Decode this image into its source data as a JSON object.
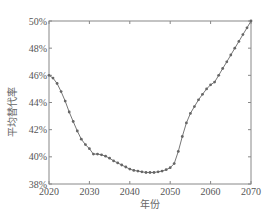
{
  "chart_data": {
    "type": "line",
    "title": "",
    "xlabel": "年份",
    "ylabel": "平均替代率",
    "xlim": [
      2020,
      2070
    ],
    "ylim": [
      38,
      50
    ],
    "x_ticks": [
      2020,
      2030,
      2040,
      2050,
      2060,
      2070
    ],
    "y_ticks": [
      "38%",
      "40%",
      "42%",
      "44%",
      "46%",
      "48%",
      "50%"
    ],
    "grid": false,
    "legend": null,
    "series": [
      {
        "name": "平均替代率",
        "color": "#777777",
        "marker": "circle",
        "x": [
          2020,
          2021,
          2022,
          2023,
          2024,
          2025,
          2026,
          2027,
          2028,
          2029,
          2030,
          2031,
          2032,
          2033,
          2034,
          2035,
          2036,
          2037,
          2038,
          2039,
          2040,
          2041,
          2042,
          2043,
          2044,
          2045,
          2046,
          2047,
          2048,
          2049,
          2050,
          2051,
          2052,
          2053,
          2054,
          2055,
          2056,
          2057,
          2058,
          2059,
          2060,
          2061,
          2062,
          2063,
          2064,
          2065,
          2066,
          2067,
          2068,
          2069,
          2070
        ],
        "values": [
          46.0,
          45.8,
          45.4,
          44.8,
          44.1,
          43.3,
          42.6,
          41.9,
          41.3,
          40.9,
          40.6,
          40.2,
          40.2,
          40.15,
          40.05,
          39.9,
          39.7,
          39.55,
          39.4,
          39.25,
          39.1,
          39.0,
          38.95,
          38.9,
          38.85,
          38.85,
          38.85,
          38.9,
          38.95,
          39.05,
          39.2,
          39.5,
          40.4,
          41.5,
          42.5,
          43.2,
          43.7,
          44.2,
          44.6,
          45.0,
          45.3,
          45.5,
          46.0,
          46.5,
          47.0,
          47.5,
          48.0,
          48.5,
          49.0,
          49.5,
          50.0
        ]
      }
    ]
  }
}
